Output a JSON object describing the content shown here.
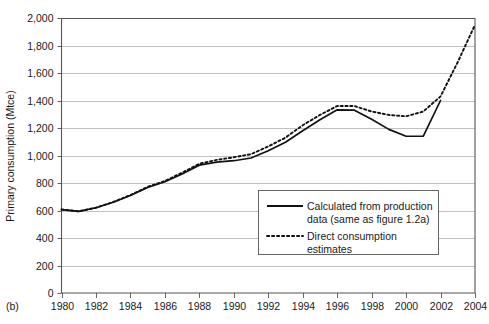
{
  "figure": {
    "panel_label": "(b)"
  },
  "chart_data": {
    "type": "line",
    "title": "",
    "xlabel": "",
    "ylabel": "Primary consumption (Mtce)",
    "xlim": [
      1980,
      2004
    ],
    "ylim": [
      0,
      2000
    ],
    "grid": true,
    "legend_position": "inside-lower-right",
    "x_tick_labels": [
      "1980",
      "1982",
      "1984",
      "1986",
      "1988",
      "1990",
      "1992",
      "1994",
      "1996",
      "1998",
      "2000",
      "2002",
      "2004"
    ],
    "x_tick_values": [
      1980,
      1982,
      1984,
      1986,
      1988,
      1990,
      1992,
      1994,
      1996,
      1998,
      2000,
      2002,
      2004
    ],
    "y_tick_labels": [
      "0",
      "200",
      "400",
      "600",
      "800",
      "1,000",
      "1,200",
      "1,400",
      "1,600",
      "1,800",
      "2,000"
    ],
    "y_tick_values": [
      0,
      200,
      400,
      600,
      800,
      1000,
      1200,
      1400,
      1600,
      1800,
      2000
    ],
    "x": [
      1980,
      1981,
      1982,
      1983,
      1984,
      1985,
      1986,
      1987,
      1988,
      1989,
      1990,
      1991,
      1992,
      1993,
      1994,
      1995,
      1996,
      1997,
      1998,
      1999,
      2000,
      2001,
      2002,
      2003,
      2004
    ],
    "series": [
      {
        "name": "Calculated from production data (same as figure 1.2a)",
        "style": "solid",
        "color": "#111111",
        "values": [
          607,
          594,
          620,
          660,
          709,
          767,
          809,
          866,
          930,
          952,
          962,
          982,
          1035,
          1096,
          1180,
          1260,
          1332,
          1330,
          1264,
          1190,
          1140,
          1141,
          1400,
          null,
          null
        ]
      },
      {
        "name": "Direct consumption estimates",
        "style": "dotted",
        "color": "#111111",
        "values": [
          607,
          594,
          620,
          662,
          712,
          772,
          815,
          875,
          940,
          968,
          987,
          1010,
          1066,
          1130,
          1220,
          1295,
          1360,
          1360,
          1320,
          1295,
          1285,
          1320,
          1430,
          1680,
          1950
        ]
      }
    ]
  },
  "legend": {
    "entries": [
      {
        "label_line1": "Calculated from production",
        "label_line2": "data (same as figure 1.2a)",
        "style": "solid"
      },
      {
        "label_line1": "Direct consumption",
        "label_line2": "estimates",
        "style": "dotted"
      }
    ]
  }
}
